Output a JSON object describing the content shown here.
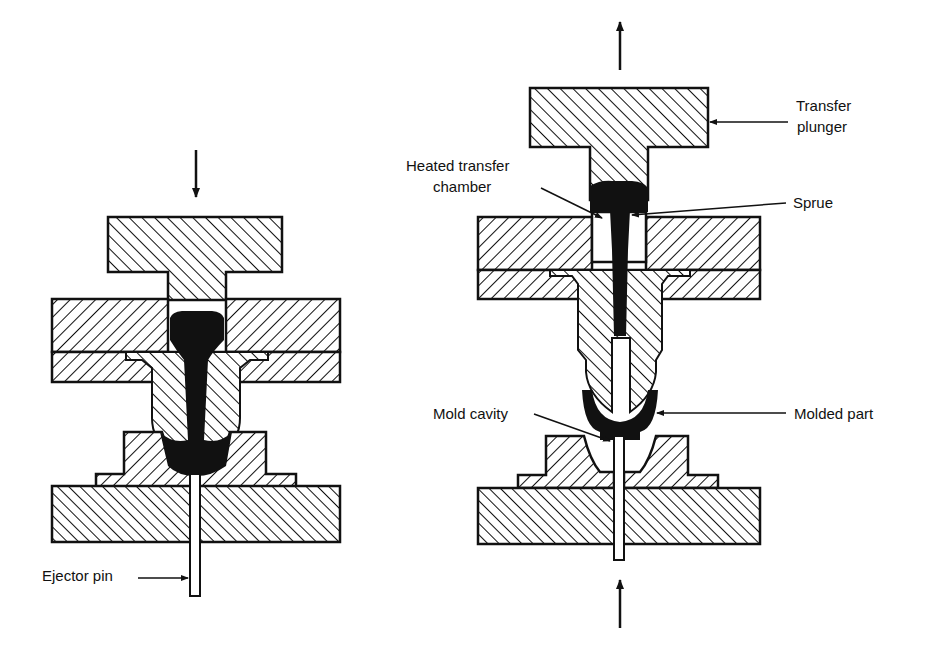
{
  "figure": {
    "type": "transfer-molding-process-diagram",
    "panels": [
      {
        "id": "left",
        "state": "molding (plunger pressing down)",
        "arrow": "down",
        "labels": [
          {
            "id": "ejector-pin",
            "text": "Ejector pin"
          }
        ]
      },
      {
        "id": "right",
        "state": "mold open, part ejected",
        "arrows": [
          "up (top)",
          "up (bottom)"
        ],
        "labels": [
          {
            "id": "transfer-plunger-line1",
            "text": "Transfer"
          },
          {
            "id": "transfer-plunger-line2",
            "text": "plunger"
          },
          {
            "id": "heated-chamber-line1",
            "text": "Heated transfer"
          },
          {
            "id": "heated-chamber-line2",
            "text": "chamber"
          },
          {
            "id": "sprue",
            "text": "Sprue"
          },
          {
            "id": "mold-cavity",
            "text": "Mold cavity"
          },
          {
            "id": "molded-part",
            "text": "Molded part"
          }
        ]
      }
    ]
  },
  "labels": {
    "ejector_pin": "Ejector pin",
    "transfer_plunger_1": "Transfer",
    "transfer_plunger_2": "plunger",
    "heated_chamber_1": "Heated transfer",
    "heated_chamber_2": "chamber",
    "sprue": "Sprue",
    "mold_cavity": "Mold cavity",
    "molded_part": "Molded part"
  },
  "colors": {
    "ink": "#111111",
    "background": "#ffffff"
  }
}
